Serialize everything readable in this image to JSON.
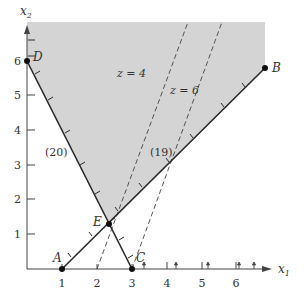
{
  "figure": {
    "type": "linear-programming-feasible-region",
    "axes": {
      "x_label": "x",
      "x_sub": "1",
      "y_label": "x",
      "y_sub": "2",
      "x_ticks": [
        "1",
        "2",
        "3",
        "4",
        "5",
        "6"
      ],
      "y_ticks": [
        "1",
        "2",
        "3",
        "4",
        "5",
        "6"
      ]
    },
    "points": [
      {
        "name": "A",
        "x": 1,
        "y": 0
      },
      {
        "name": "B",
        "x": 6.8,
        "y": 5.8
      },
      {
        "name": "C",
        "x": 3,
        "y": 0
      },
      {
        "name": "D",
        "x": 0,
        "y": 6
      },
      {
        "name": "E",
        "x": 2.33,
        "y": 1.33
      }
    ],
    "constraints": [
      {
        "label": "(20)",
        "from": "D",
        "to": "C"
      },
      {
        "label": "(19)",
        "from": "A",
        "to": "B"
      }
    ],
    "objective_lines": [
      {
        "label": "z = 4",
        "style": "dashed"
      },
      {
        "label": "z = 6",
        "style": "dashed"
      }
    ],
    "colors": {
      "feasible_region": "#d4d4d4",
      "lines": "#2a2a2a",
      "text": "#333333"
    }
  }
}
